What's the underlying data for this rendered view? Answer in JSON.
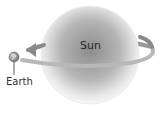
{
  "diagram": {
    "sun": {
      "label": "Sun",
      "color": "#8f8f8f"
    },
    "earth": {
      "label": "Earth"
    },
    "orbit": {
      "color": "#8a8a8a",
      "direction": "counterclockwise-arrow-left"
    }
  }
}
